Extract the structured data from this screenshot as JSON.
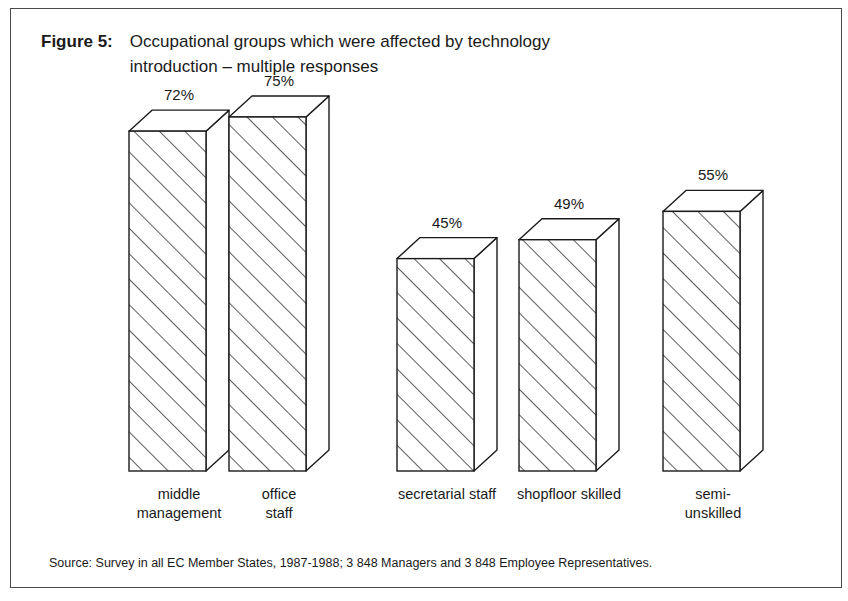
{
  "figure": {
    "label": "Figure 5:",
    "title": "Occupational groups which were affected by technology introduction – multiple responses",
    "title_line1": "Occupational groups which were affected by technology",
    "title_line2": "introduction – multiple responses"
  },
  "source": {
    "text": "Source: Survey in all EC Member States, 1987-1988; 3 848 Managers and 3 848 Employee Representatives."
  },
  "colors": {
    "frame_border": "#4a4a4a",
    "bar_outline": "#1a1a1a",
    "bar_face": "#ffffff",
    "hatch": "#333333",
    "text": "#1a1a1a",
    "background": "#ffffff"
  },
  "chart_data": {
    "type": "bar",
    "title": "Occupational groups which were affected by technology introduction – multiple responses",
    "xlabel": "",
    "ylabel": "",
    "ylim": [
      0,
      100
    ],
    "grid": false,
    "legend": "none",
    "value_suffix": "%",
    "style": "3d-isometric-hatched-columns",
    "categories": [
      "middle management",
      "office staff",
      "secretarial staff",
      "shopfloor skilled",
      "semi-unskilled"
    ],
    "category_lines": [
      [
        "middle",
        "management"
      ],
      [
        "office",
        "staff"
      ],
      [
        "secretarial staff"
      ],
      [
        "shopfloor skilled"
      ],
      [
        "semi-",
        "unskilled"
      ]
    ],
    "values": [
      72,
      75,
      45,
      49,
      55
    ],
    "value_labels": [
      "72%",
      "75%",
      "45%",
      "49%",
      "55%"
    ]
  }
}
